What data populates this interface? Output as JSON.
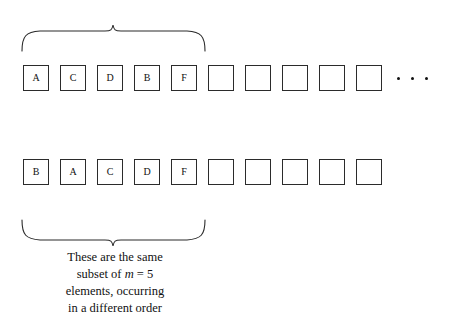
{
  "figure": {
    "background_color": "#ffffff",
    "ink_color": "#111111"
  },
  "top_row": {
    "name": "first-sequence",
    "total_cells": 10,
    "filled_labels": [
      "A",
      "C",
      "D",
      "B",
      "F"
    ],
    "empty_cells": 5,
    "cells": [
      {
        "label": "A",
        "filled": true
      },
      {
        "label": "C",
        "filled": true
      },
      {
        "label": "D",
        "filled": true
      },
      {
        "label": "B",
        "filled": true
      },
      {
        "label": "F",
        "filled": true
      },
      {
        "label": "",
        "filled": false
      },
      {
        "label": "",
        "filled": false
      },
      {
        "label": "",
        "filled": false
      },
      {
        "label": "",
        "filled": false
      },
      {
        "label": "",
        "filled": false
      }
    ],
    "ellipsis": "• • •",
    "ellipsis_dots": 3
  },
  "bottom_row": {
    "name": "second-sequence",
    "total_cells": 10,
    "filled_labels": [
      "B",
      "A",
      "C",
      "D",
      "F"
    ],
    "empty_cells": 5,
    "cells": [
      {
        "label": "B",
        "filled": true
      },
      {
        "label": "A",
        "filled": true
      },
      {
        "label": "C",
        "filled": true
      },
      {
        "label": "D",
        "filled": true
      },
      {
        "label": "F",
        "filled": true
      },
      {
        "label": "",
        "filled": false
      },
      {
        "label": "",
        "filled": false
      },
      {
        "label": "",
        "filled": false
      },
      {
        "label": "",
        "filled": false
      },
      {
        "label": "",
        "filled": false
      }
    ],
    "ellipsis": "",
    "ellipsis_dots": 0
  },
  "top_brace": {
    "name": "top-brace",
    "orientation": "opens-down",
    "spans_cells": 5,
    "label": ""
  },
  "bottom_brace": {
    "name": "bottom-brace",
    "orientation": "opens-up",
    "spans_cells": 5,
    "label": ""
  },
  "caption": {
    "line1": "These are the same",
    "line2_prefix": "subset of ",
    "line2_var": "m",
    "line2_eq": " = ",
    "line2_value": "5",
    "line3": "elements, occurring",
    "line4": "in a different order",
    "full_text": "These are the same subset of m = 5 elements, occurring in a different order"
  },
  "annotation": {
    "m_symbol": "m",
    "m_value": "5"
  }
}
